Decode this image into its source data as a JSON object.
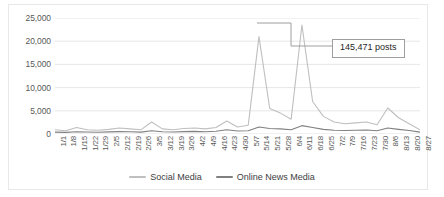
{
  "chart_data": {
    "type": "line",
    "title": "",
    "xlabel": "",
    "ylabel": "",
    "ylim": [
      0,
      25000
    ],
    "ytick_values": [
      25000,
      20000,
      15000,
      10000,
      5000,
      0
    ],
    "ytick_labels": [
      "25,000",
      "20,000",
      "15,000",
      "10,000",
      "5,000",
      "0"
    ],
    "grid": true,
    "legend_position": "bottom-center",
    "categories": [
      "1/1",
      "1/8",
      "1/15",
      "1/22",
      "1/29",
      "2/5",
      "2/12",
      "2/19",
      "2/26",
      "3/5",
      "3/12",
      "3/19",
      "3/26",
      "4/2",
      "4/9",
      "4/16",
      "4/23",
      "4/30",
      "5/7",
      "5/14",
      "5/21",
      "5/28",
      "6/4",
      "6/11",
      "6/18",
      "6/25",
      "7/2",
      "7/9",
      "7/16",
      "7/23",
      "7/30",
      "8/6",
      "8/13",
      "8/20",
      "8/27"
    ],
    "series": [
      {
        "name": "Social Media",
        "color": "#bfbfbf",
        "values": [
          900,
          700,
          1400,
          900,
          800,
          1000,
          1300,
          1100,
          900,
          2600,
          1100,
          900,
          1200,
          1300,
          1100,
          1400,
          2800,
          1500,
          1900,
          21000,
          5500,
          4500,
          3200,
          23500,
          7000,
          3800,
          2600,
          2200,
          2400,
          2600,
          2000,
          5600,
          3500,
          2200,
          900
        ]
      },
      {
        "name": "Online News Media",
        "color": "#808080",
        "values": [
          400,
          350,
          500,
          420,
          380,
          450,
          520,
          480,
          400,
          700,
          500,
          430,
          520,
          560,
          480,
          600,
          900,
          650,
          700,
          1500,
          1200,
          1100,
          900,
          1800,
          1400,
          1000,
          800,
          750,
          800,
          850,
          700,
          1300,
          1000,
          750,
          400
        ]
      }
    ],
    "annotations": [
      {
        "text": "145,471 posts",
        "target_category": "5/21",
        "target_value": 21000
      }
    ]
  },
  "legend": {
    "items": [
      {
        "label": "Social Media",
        "color": "#bfbfbf"
      },
      {
        "label": "Online News Media",
        "color": "#808080"
      }
    ]
  },
  "annotation": {
    "label": "145,471 posts"
  },
  "colors": {
    "social_media": "#bfbfbf",
    "online_news_media": "#808080",
    "gridline": "#e0e0e0",
    "axis_text": "#595959",
    "callout_border": "#9e9e9e"
  }
}
